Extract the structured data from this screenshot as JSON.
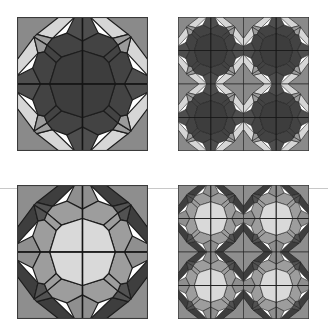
{
  "figure": {
    "background": "#ffffff",
    "divider_color": "#c8c8c8",
    "panels": [
      {
        "id": "top-left",
        "label": "single block, dark colorway",
        "tiling": 1,
        "position": {
          "x": 17,
          "y": 17
        },
        "palette": {
          "corner": "#8a8a8a",
          "outer": "#d6d6d6",
          "band": "#9b9b9b",
          "star": "#4e4e4e",
          "field": "#434343",
          "center": "#3d3d3d"
        }
      },
      {
        "id": "top-right",
        "label": "2x2 tiling, dark colorway",
        "tiling": 2,
        "position": {
          "x": 178,
          "y": 17
        },
        "palette": {
          "corner": "#8a8a8a",
          "outer": "#d6d6d6",
          "band": "#9b9b9b",
          "star": "#4e4e4e",
          "field": "#434343",
          "center": "#3d3d3d"
        }
      },
      {
        "id": "bottom-left",
        "label": "single block, light colorway",
        "tiling": 1,
        "position": {
          "x": 17,
          "y": 185
        },
        "palette": {
          "corner": "#8e8e8e",
          "outer": "#3e3e3e",
          "band": "#525252",
          "star": "#8f8f8f",
          "field": "#9d9d9d",
          "center": "#d9d9d9"
        }
      },
      {
        "id": "bottom-right",
        "label": "2x2 tiling, light colorway",
        "tiling": 2,
        "position": {
          "x": 178,
          "y": 185
        },
        "palette": {
          "corner": "#8e8e8e",
          "outer": "#3e3e3e",
          "band": "#525252",
          "star": "#8f8f8f",
          "field": "#9d9d9d",
          "center": "#d9d9d9"
        }
      }
    ]
  }
}
